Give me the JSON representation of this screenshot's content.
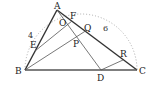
{
  "diagram": {
    "colors": {
      "line": "#333333",
      "thin_line": "#555555",
      "arc": "#aaaaaa",
      "text": "#222222",
      "background": "#ffffff"
    },
    "points": {
      "A": {
        "label": "A",
        "x": 57,
        "y": 10
      },
      "B": {
        "label": "B",
        "x": 25,
        "y": 70
      },
      "C": {
        "label": "C",
        "x": 137,
        "y": 70
      },
      "D": {
        "label": "D",
        "x": 101,
        "y": 70
      },
      "E": {
        "label": "E",
        "x": 35,
        "y": 51
      },
      "F": {
        "label": "F",
        "x": 72,
        "y": 21
      },
      "O": {
        "label": "O",
        "x": 66,
        "y": 26
      },
      "Q": {
        "label": "Q",
        "x": 87,
        "y": 30
      },
      "P": {
        "label": "P",
        "x": 77,
        "y": 41
      },
      "R": {
        "label": "R",
        "x": 123,
        "y": 60
      }
    },
    "segments": [
      {
        "from": "A",
        "to": "B",
        "style": "thick"
      },
      {
        "from": "A",
        "to": "C",
        "style": "thick"
      },
      {
        "from": "B",
        "to": "C",
        "style": "thick"
      },
      {
        "from": "E",
        "to": "F",
        "style": "thin"
      },
      {
        "from": "B",
        "to": "Q",
        "style": "thin"
      },
      {
        "from": "A",
        "to": "D",
        "style": "thin"
      },
      {
        "from": "D",
        "to": "R",
        "style": "thin"
      }
    ],
    "arc": {
      "type": "semicircle",
      "diameter": [
        "B",
        "C"
      ],
      "style": "dotted"
    },
    "length_labels": [
      {
        "text": "4",
        "near": "AB",
        "x": 28,
        "y": 38
      },
      {
        "text": "6",
        "near": "AC",
        "x": 103,
        "y": 31
      }
    ]
  }
}
